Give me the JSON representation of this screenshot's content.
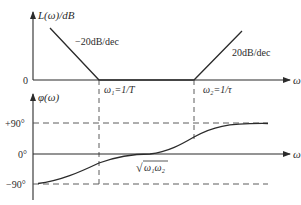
{
  "diagram": {
    "type": "bode-plot",
    "colors": {
      "line": "#2b2b2b",
      "dashed": "#4a4a4a",
      "background": "#ffffff"
    },
    "magnitude_plot": {
      "y_axis_label": "L(ω)/dB",
      "x_axis_label": "ω",
      "zero_label": "0",
      "slopes": [
        {
          "label": "−20dB/dec",
          "segment": "low-frequency"
        },
        {
          "label": "20dB/dec",
          "segment": "high-frequency"
        }
      ],
      "breakpoints": [
        {
          "label": "ω₁=1/T"
        },
        {
          "label": "ω₂=1/τ"
        }
      ]
    },
    "phase_plot": {
      "y_axis_label": "φ(ω)",
      "x_axis_label": "ω",
      "ticks": [
        "+90°",
        "0°",
        "−90°"
      ],
      "crossing_label": "ω₁ω₂",
      "crossing_prefix": "√"
    }
  }
}
